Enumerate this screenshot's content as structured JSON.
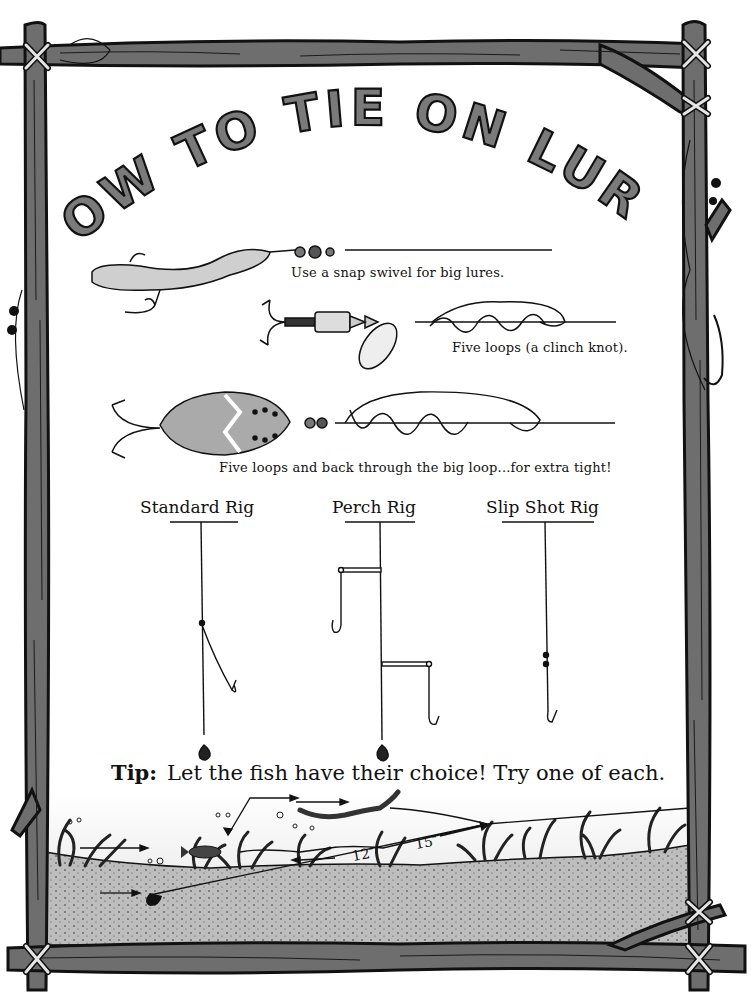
{
  "title": "HOW TO TIE ON LURES",
  "title_words": [
    "HOW",
    "TO",
    "TIE",
    "ON",
    "LURES"
  ],
  "lures": [
    {
      "caption": "Use a snap swivel for big lures.",
      "lure": "spoon-with-treble-hook"
    },
    {
      "caption": "Five loops (a clinch knot).",
      "lure": "spinner"
    },
    {
      "caption": "Five loops and back through the big loop...for extra tight!",
      "lure": "spoon-daredevil"
    }
  ],
  "rigs": [
    {
      "title": "Standard Rig"
    },
    {
      "title": "Perch Rig"
    },
    {
      "title": "Slip Shot Rig"
    }
  ],
  "tip": {
    "label": "Tip:",
    "text": "Let the fish have their choice! Try one of each."
  },
  "scene": {
    "measure_left": "12″",
    "measure_right": "15″"
  },
  "colors": {
    "wood": "#6e6e6e",
    "wood_dark": "#1a1a1a",
    "lashing": "#d8d8d8",
    "sand": "#b9b9b9",
    "water": "#f2f2f2",
    "ink": "#111111"
  }
}
